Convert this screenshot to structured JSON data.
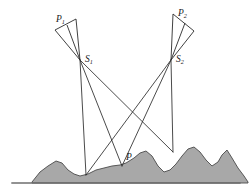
{
  "figure": {
    "background_color": "#ffffff"
  },
  "labels": {
    "camera_left_name": "P",
    "camera_left_sub": "1",
    "camera_right_name": "P",
    "camera_right_sub": "2",
    "station_left_name": "S",
    "station_left_sub": "1",
    "station_right_name": "S",
    "station_right_sub": "2",
    "ground_point_name": "P",
    "ground_point_sub": ""
  },
  "colors": {
    "terrain_fill": "#a8a8a8",
    "terrain_stroke": "#4a4a4a",
    "ray_stroke": "#2b2b2b",
    "baseline_stroke": "#6e6e6e",
    "label_color": "#1a1a1a"
  },
  "chart_data": {
    "type": "diagram",
    "xlim": [
      0,
      252
    ],
    "ylim": [
      0,
      196
    ],
    "grid": false,
    "legend": null,
    "points": [
      {
        "name": "P1",
        "label": "P₁",
        "x": 60,
        "y": 22,
        "role": "camera-image-plane-corner-left"
      },
      {
        "name": "S1",
        "label": "S₁",
        "x": 80,
        "y": 60,
        "role": "perspective-center-left"
      },
      {
        "name": "P2",
        "label": "P₂",
        "x": 182,
        "y": 15,
        "role": "camera-image-plane-corner-right"
      },
      {
        "name": "S2",
        "label": "S₂",
        "x": 171,
        "y": 60,
        "role": "perspective-center-right"
      },
      {
        "name": "P",
        "label": "P",
        "x": 124,
        "y": 163,
        "role": "ground-point"
      }
    ],
    "camera_left": {
      "apex": {
        "x": 80,
        "y": 60
      },
      "image_plane": [
        {
          "x": 55,
          "y": 30
        },
        {
          "x": 76,
          "y": 19
        }
      ],
      "interior_ray_end": {
        "x": 67,
        "y": 25
      }
    },
    "camera_right": {
      "apex": {
        "x": 171,
        "y": 60
      },
      "image_plane": [
        {
          "x": 194,
          "y": 31
        },
        {
          "x": 173,
          "y": 14
        }
      ],
      "interior_ray_end": {
        "x": 185,
        "y": 23
      }
    },
    "rays": [
      {
        "from": "S1",
        "to_x": 86,
        "to_y": 175,
        "note": "left station to near ground point"
      },
      {
        "from": "S1",
        "to_x": 122,
        "to_y": 166,
        "note": "left station to ground point P"
      },
      {
        "from": "S1",
        "to_x": 173,
        "to_y": 152,
        "note": "left station to far right ground point"
      },
      {
        "from": "S2",
        "to_x": 86,
        "to_y": 175,
        "note": "right station to near left ground point"
      },
      {
        "from": "S2",
        "to_x": 122,
        "to_y": 166,
        "note": "right station to ground point P"
      },
      {
        "from": "S2",
        "to_x": 173,
        "to_y": 152,
        "note": "right station to ground point below"
      }
    ],
    "terrain_profile": [
      {
        "x": 32,
        "y": 182
      },
      {
        "x": 40,
        "y": 172
      },
      {
        "x": 48,
        "y": 166
      },
      {
        "x": 56,
        "y": 161
      },
      {
        "x": 62,
        "y": 163
      },
      {
        "x": 68,
        "y": 170
      },
      {
        "x": 74,
        "y": 174
      },
      {
        "x": 80,
        "y": 176
      },
      {
        "x": 88,
        "y": 174
      },
      {
        "x": 96,
        "y": 170
      },
      {
        "x": 104,
        "y": 168
      },
      {
        "x": 112,
        "y": 166
      },
      {
        "x": 120,
        "y": 165
      },
      {
        "x": 126,
        "y": 163
      },
      {
        "x": 134,
        "y": 158
      },
      {
        "x": 140,
        "y": 153
      },
      {
        "x": 146,
        "y": 151
      },
      {
        "x": 152,
        "y": 156
      },
      {
        "x": 158,
        "y": 166
      },
      {
        "x": 164,
        "y": 172
      },
      {
        "x": 170,
        "y": 170
      },
      {
        "x": 176,
        "y": 164
      },
      {
        "x": 182,
        "y": 156
      },
      {
        "x": 188,
        "y": 149
      },
      {
        "x": 194,
        "y": 147
      },
      {
        "x": 200,
        "y": 152
      },
      {
        "x": 206,
        "y": 160
      },
      {
        "x": 212,
        "y": 166
      },
      {
        "x": 218,
        "y": 162
      },
      {
        "x": 222,
        "y": 155
      },
      {
        "x": 227,
        "y": 150
      },
      {
        "x": 232,
        "y": 158
      },
      {
        "x": 238,
        "y": 168
      },
      {
        "x": 244,
        "y": 176
      },
      {
        "x": 248,
        "y": 182
      }
    ],
    "baseline": {
      "x1": 12,
      "y1": 183,
      "x2": 240,
      "y2": 183
    }
  }
}
